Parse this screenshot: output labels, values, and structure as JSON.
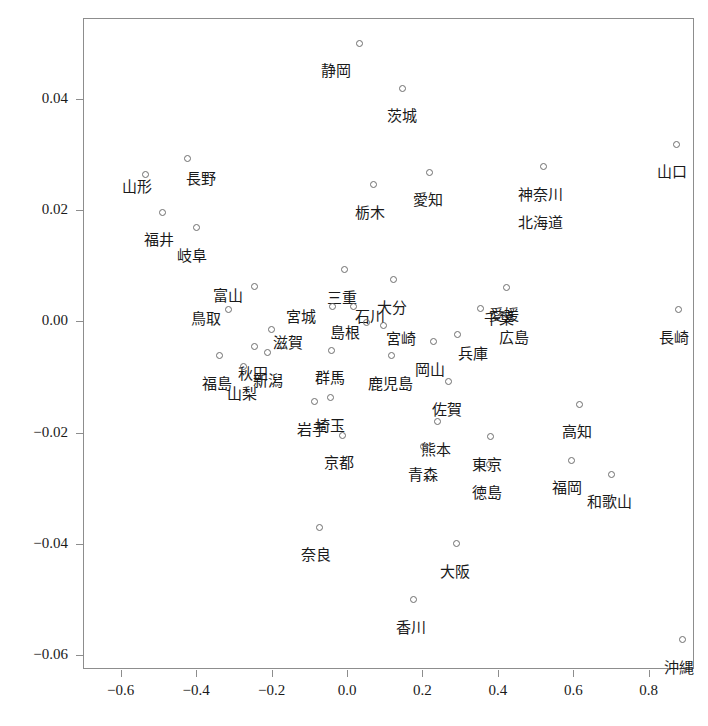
{
  "chart_data": {
    "type": "scatter",
    "title": "",
    "xlabel": "",
    "ylabel": "",
    "xlim": [
      -0.7,
      0.92
    ],
    "ylim": [
      -0.0625,
      0.0545
    ],
    "grid": false,
    "legend": null,
    "marker": "open-circle",
    "xticks": [
      -0.6,
      -0.4,
      -0.2,
      0.0,
      0.2,
      0.4,
      0.6,
      0.8
    ],
    "xticklabels": [
      "-0.6",
      "-0.4",
      "-0.2",
      "0.0",
      "0.2",
      "0.4",
      "0.6",
      "0.8"
    ],
    "yticks": [
      0.04,
      0.02,
      0.0,
      -0.02,
      -0.04,
      -0.06
    ],
    "yticklabels": [
      "0.04",
      "0.02",
      "0.00",
      "-0.02",
      "-0.04",
      "-0.06"
    ],
    "points": [
      {
        "label": "静岡",
        "x": 0.032,
        "y": 0.05,
        "lx": -0.06,
        "ly": -0.0038
      },
      {
        "label": "茨城",
        "x": 0.147,
        "y": 0.0419,
        "lx": 0.0,
        "ly": -0.0038
      },
      {
        "label": "山口",
        "x": 0.873,
        "y": 0.0318,
        "lx": -0.012,
        "ly": -0.0038
      },
      {
        "label": "長野",
        "x": -0.422,
        "y": 0.0292,
        "lx": 0.035,
        "ly": -0.0023
      },
      {
        "label": "山形",
        "x": -0.534,
        "y": 0.0263,
        "lx": -0.022,
        "ly": -0.001
      },
      {
        "label": "愛知",
        "x": 0.22,
        "y": 0.0268,
        "lx": -0.006,
        "ly": -0.0038
      },
      {
        "label": "神奈川",
        "x": 0.52,
        "y": 0.0278,
        "lx": -0.006,
        "ly": -0.0038
      },
      {
        "label": "北海道",
        "x": 0.52,
        "y": 0.0278,
        "lx": -0.006,
        "ly": -0.0088
      },
      {
        "label": "栃木",
        "x": 0.07,
        "y": 0.0246,
        "lx": -0.01,
        "ly": -0.0038
      },
      {
        "label": "福井",
        "x": -0.489,
        "y": 0.0196,
        "lx": -0.01,
        "ly": -0.0038
      },
      {
        "label": "岐阜",
        "x": -0.4,
        "y": 0.0168,
        "lx": -0.01,
        "ly": -0.0038
      },
      {
        "label": "三重",
        "x": -0.006,
        "y": 0.0093,
        "lx": -0.006,
        "ly": -0.0038
      },
      {
        "label": "大分",
        "x": 0.124,
        "y": 0.0075,
        "lx": -0.006,
        "ly": -0.0038
      },
      {
        "label": "富山",
        "x": -0.246,
        "y": 0.0063,
        "lx": -0.07,
        "ly": -0.0005
      },
      {
        "label": "愛媛",
        "x": 0.422,
        "y": 0.0061,
        "lx": -0.006,
        "ly": -0.0038
      },
      {
        "label": "宮城",
        "x": -0.039,
        "y": 0.0026,
        "lx": -0.082,
        "ly": -0.0006
      },
      {
        "label": "石川",
        "x": 0.018,
        "y": 0.0026,
        "lx": 0.042,
        "ly": -0.0006
      },
      {
        "label": "鳥取",
        "x": -0.313,
        "y": 0.0022,
        "lx": -0.062,
        "ly": -0.0005
      },
      {
        "label": "千葉",
        "x": 0.355,
        "y": 0.0023,
        "lx": 0.048,
        "ly": -0.0007
      },
      {
        "label": "広島",
        "x": 0.412,
        "y": 0.0012,
        "lx": 0.032,
        "ly": -0.003
      },
      {
        "label": "長崎",
        "x": 0.879,
        "y": 0.0021,
        "lx": -0.012,
        "ly": -0.0038
      },
      {
        "label": "島根",
        "x": 0.051,
        "y": -0.0003,
        "lx": -0.056,
        "ly": -0.0006
      },
      {
        "label": "宮崎",
        "x": 0.098,
        "y": -0.0007,
        "lx": 0.046,
        "ly": -0.0012
      },
      {
        "label": "滋賀",
        "x": -0.201,
        "y": -0.0014,
        "lx": 0.044,
        "ly": -0.0012
      },
      {
        "label": "兵庫",
        "x": 0.294,
        "y": -0.0024,
        "lx": 0.04,
        "ly": -0.0022
      },
      {
        "label": "岡山",
        "x": 0.23,
        "y": -0.0037,
        "lx": -0.01,
        "ly": -0.0038
      },
      {
        "label": "秋田",
        "x": -0.246,
        "y": -0.0045,
        "lx": -0.004,
        "ly": -0.0038
      },
      {
        "label": "新潟",
        "x": -0.21,
        "y": -0.0057,
        "lx": 0.0,
        "ly": -0.0038
      },
      {
        "label": "群馬",
        "x": -0.042,
        "y": -0.0052,
        "lx": -0.002,
        "ly": -0.0038
      },
      {
        "label": "福島",
        "x": -0.338,
        "y": -0.0062,
        "lx": -0.008,
        "ly": -0.0038
      },
      {
        "label": "山梨",
        "x": -0.275,
        "y": -0.0081,
        "lx": -0.004,
        "ly": -0.0038
      },
      {
        "label": "鹿児島",
        "x": 0.117,
        "y": -0.0062,
        "lx": -0.002,
        "ly": -0.0038
      },
      {
        "label": "佐賀",
        "x": 0.268,
        "y": -0.0109,
        "lx": -0.002,
        "ly": -0.0038
      },
      {
        "label": "岩手",
        "x": -0.086,
        "y": -0.0145,
        "lx": -0.006,
        "ly": -0.0038
      },
      {
        "label": "埼玉",
        "x": -0.045,
        "y": -0.0137,
        "lx": 0.0,
        "ly": -0.0038
      },
      {
        "label": "高知",
        "x": 0.617,
        "y": -0.0149,
        "lx": -0.008,
        "ly": -0.0038
      },
      {
        "label": "熊本",
        "x": 0.24,
        "y": -0.0181,
        "lx": -0.004,
        "ly": -0.0038
      },
      {
        "label": "京都",
        "x": -0.013,
        "y": -0.0205,
        "lx": -0.008,
        "ly": -0.0038
      },
      {
        "label": "青森",
        "x": 0.203,
        "y": -0.0226,
        "lx": -0.002,
        "ly": -0.0038
      },
      {
        "label": "東京",
        "x": 0.38,
        "y": -0.0208,
        "lx": -0.008,
        "ly": -0.0038
      },
      {
        "label": "福岡",
        "x": 0.594,
        "y": -0.025,
        "lx": -0.01,
        "ly": -0.0038
      },
      {
        "label": "徳島",
        "x": 0.377,
        "y": -0.0258,
        "lx": -0.006,
        "ly": -0.0038
      },
      {
        "label": "和歌山",
        "x": 0.7,
        "y": -0.0275,
        "lx": -0.004,
        "ly": -0.0038
      },
      {
        "label": "奈良",
        "x": -0.073,
        "y": -0.037,
        "lx": -0.008,
        "ly": -0.0038
      },
      {
        "label": "大阪",
        "x": 0.29,
        "y": -0.04,
        "lx": -0.004,
        "ly": -0.0038
      },
      {
        "label": "香川",
        "x": 0.175,
        "y": -0.05,
        "lx": -0.006,
        "ly": -0.0038
      },
      {
        "label": "沖縄",
        "x": 0.89,
        "y": -0.0572,
        "lx": -0.01,
        "ly": -0.0038
      }
    ]
  }
}
